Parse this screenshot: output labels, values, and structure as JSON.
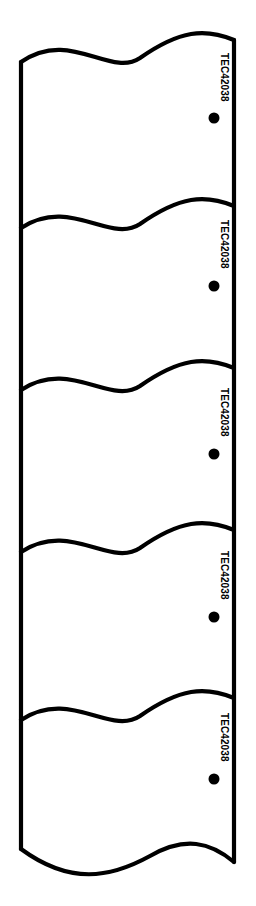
{
  "figure": {
    "type": "technical-line-drawing",
    "background_color": "#ffffff",
    "stroke_color": "#000000",
    "stroke_width": 4.2,
    "canvas": {
      "width": 256,
      "height": 906
    },
    "body": {
      "left_edge_x": 21,
      "right_edge_x": 234,
      "top_y": 30,
      "bottom_y": 880
    },
    "panel_count": 5,
    "panels": [
      {
        "index": 1,
        "label": "TEC42038",
        "label_x": 217,
        "label_y": 80,
        "dot": {
          "cx": 214,
          "cy": 118,
          "r": 5.5
        },
        "wave_top_y": 38,
        "wave_bottom_y": 205
      },
      {
        "index": 2,
        "label": "TEC42038",
        "label_x": 217,
        "label_y": 247,
        "dot": {
          "cx": 214,
          "cy": 286,
          "r": 5.5
        },
        "wave_top_y": 205,
        "wave_bottom_y": 368
      },
      {
        "index": 3,
        "label": "TEC42038",
        "label_x": 217,
        "label_y": 415,
        "dot": {
          "cx": 214,
          "cy": 454,
          "r": 5.5
        },
        "wave_top_y": 368,
        "wave_bottom_y": 527
      },
      {
        "index": 4,
        "label": "TEC42038",
        "label_x": 217,
        "label_y": 578,
        "dot": {
          "cx": 214,
          "cy": 617,
          "r": 5.5
        },
        "wave_top_y": 527,
        "wave_bottom_y": 695
      },
      {
        "index": 5,
        "label": "TEC42038",
        "label_x": 217,
        "label_y": 740,
        "dot": {
          "cx": 214,
          "cy": 779,
          "r": 5.5
        },
        "wave_top_y": 695,
        "wave_bottom_y": 862
      }
    ],
    "wave_separators": [
      {
        "index": 1,
        "left_y": 62,
        "right_y": 35,
        "path": "M 21 62 C 70 28, 110 78, 140 58 C 180 30, 205 28, 234 40"
      },
      {
        "index": 2,
        "left_y": 228,
        "right_y": 200,
        "path": "M 21 228 C 70 196, 110 244, 140 224 C 180 196, 205 194, 234 206"
      },
      {
        "index": 3,
        "left_y": 390,
        "right_y": 362,
        "path": "M 21 390 C 70 358, 110 406, 140 386 C 180 358, 205 356, 234 368"
      },
      {
        "index": 4,
        "left_y": 552,
        "right_y": 524,
        "path": "M 21 552 C 70 520, 110 568, 140 548 C 180 520, 205 518, 234 530"
      },
      {
        "index": 5,
        "left_y": 720,
        "right_y": 692,
        "path": "M 21 720 C 70 688, 110 736, 140 716 C 180 688, 205 686, 234 698"
      }
    ],
    "bottom_edge": {
      "path": "M 21 849 C 70 885, 110 878, 150 856 C 185 836, 210 842, 234 862"
    },
    "label_orientation": "rotated-90-clockwise",
    "label_text": "TEC42038"
  }
}
